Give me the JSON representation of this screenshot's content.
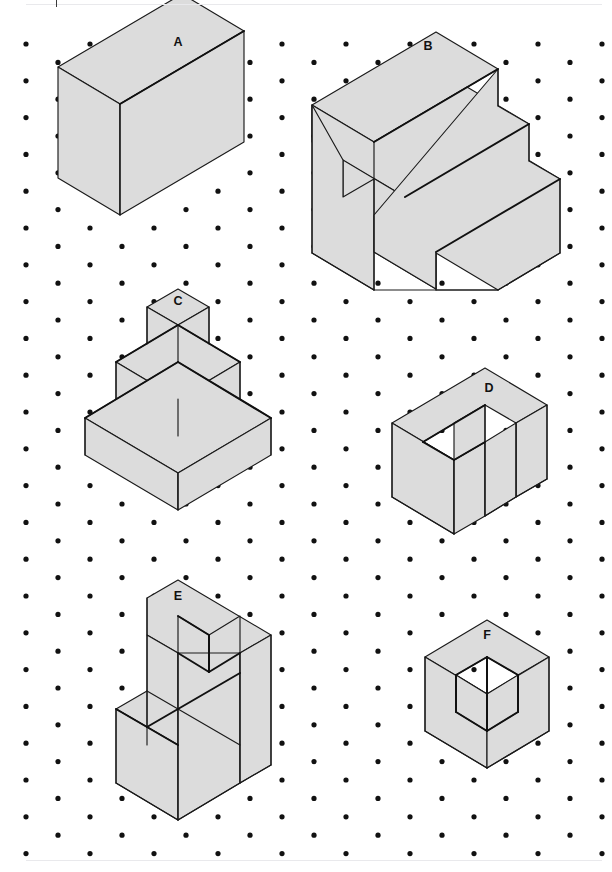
{
  "page": {
    "background_color": "#ffffff",
    "rule_color": "#e9e9ec",
    "width": 612,
    "height": 872
  },
  "grid": {
    "type": "isometric-dot-grid",
    "dot_color": "#111111",
    "dot_radius": 2.6,
    "column_spacing_px": 64,
    "row_spacing_px": 18.4,
    "origin_x": 26,
    "origin_y": 44,
    "columns": 10,
    "rows": 45,
    "stagger": "alternate rows offset by half column spacing"
  },
  "iso": {
    "unit_x": 31,
    "unit_y": 18.4,
    "vertical_unit_y": 37,
    "note": "isometric axes: right = (+31,+18.4), left = (-31,+18.4), up = (0,-37)"
  },
  "style": {
    "face_fill": "#dcdcdc",
    "edge_color": "#1a1a1a",
    "heavy_edge_color": "#111111",
    "label_color": "#111111"
  },
  "figures": [
    {
      "id": "A",
      "label": "A",
      "name": "rectangular-prism",
      "description": "Solid rectangular block, 3 units wide by 2 units deep by 2 units tall",
      "label_pos": {
        "x": 178,
        "y": 46
      },
      "origin": {
        "x": 120,
        "y": 251
      },
      "faces": [
        {
          "name": "top-face",
          "points": "120,104 58,67 182,-6 244,31"
        },
        {
          "name": "left-face",
          "points": "120,104 58,67 58,178 120,215"
        },
        {
          "name": "right-face",
          "points": "120,104 244,31 244,142 120,215"
        }
      ],
      "edges": [
        {
          "name": "vertical-front-edge",
          "d": "M120,104 L120,215"
        }
      ],
      "heavy_edges": [
        {
          "name": "top-right-ridge",
          "d": "M120,104 L244,31"
        }
      ]
    },
    {
      "id": "B",
      "label": "B",
      "name": "three-step-staircase",
      "description": "Three-tier staircase descending left to right, each step 1 unit tall and 1 unit deep",
      "label_pos": {
        "x": 428,
        "y": 50
      },
      "faces": [
        {
          "name": "step1-top",
          "points": "374,142 312,105 436,32 498,69"
        },
        {
          "name": "step2-top",
          "points": "405,197 343,160 467,87 529,124"
        },
        {
          "name": "step3-top",
          "points": "436,252 374,215 498,142 560,179"
        },
        {
          "name": "step1-riser",
          "points": "374,142 312,105 312,142 374,179"
        },
        {
          "name": "step2-riser",
          "points": "405,197 343,160 343,197 405,234"
        },
        {
          "name": "step3-riser",
          "points": "436,252 374,215 374,252 436,289"
        },
        {
          "name": "left-side-face",
          "points": "312,105 312,253 374,290 374,179 343,197 343,160"
        },
        {
          "name": "right-end-face-1",
          "points": "498,69 498,106 529,124 529,161 560,179 560,253 498,290 436,253 436,289 374,252 374,215"
        }
      ],
      "edges": [
        {
          "name": "step1-right-vertical",
          "d": "M498,69 L498,106"
        },
        {
          "name": "step2-right-vertical",
          "d": "M529,124 L529,161"
        },
        {
          "name": "step3-right-vertical",
          "d": "M560,179 L560,253"
        },
        {
          "name": "front-bottom-vertical",
          "d": "M436,253 L436,290"
        },
        {
          "name": "left-front-vertical",
          "d": "M374,179 L374,290"
        },
        {
          "name": "left-back-vertical",
          "d": "M312,105 L312,253"
        },
        {
          "name": "bottom-left-run",
          "d": "M312,253 L374,290"
        },
        {
          "name": "bottom-right-run",
          "d": "M436,290 L498,290 L498,290"
        },
        {
          "name": "bottom-front-run",
          "d": "M374,290 L498,290"
        },
        {
          "name": "bottom-right-rise",
          "d": "M498,290 L560,253"
        }
      ],
      "heavy_edges": [
        {
          "name": "step1-front-ridge",
          "d": "M374,142 L498,69"
        },
        {
          "name": "step2-front-ridge",
          "d": "M405,197 L529,124"
        },
        {
          "name": "step3-front-ridge",
          "d": "M436,252 L560,179"
        }
      ]
    },
    {
      "id": "C",
      "label": "C",
      "name": "stepped-pyramid",
      "description": "Three-tier stepped pyramid; tiers of 3x3, 2x2 and 1x1 units, each 1 unit tall",
      "label_pos": {
        "x": 178,
        "y": 305
      },
      "faces": [
        {
          "name": "tier3-top",
          "points": "178,325 147,307 178,289 209,307"
        },
        {
          "name": "tier3-left-face",
          "points": "147,307 147,344 178,362 178,325"
        },
        {
          "name": "tier3-right-face",
          "points": "209,307 209,344 178,362 178,325"
        },
        {
          "name": "tier2-top",
          "points": "178,399 116,362 178,325 240,362"
        },
        {
          "name": "tier2-left-face",
          "points": "116,362 116,399 178,436 178,399"
        },
        {
          "name": "tier2-right-face",
          "points": "240,362 240,399 178,436 178,399"
        },
        {
          "name": "tier1-top",
          "points": "178,473 85,418 178,362 271,418"
        },
        {
          "name": "tier1-left-face",
          "points": "85,418 85,455 178,510 178,473"
        },
        {
          "name": "tier1-right-face",
          "points": "271,418 271,455 178,510 178,473"
        }
      ],
      "edges": [
        {
          "name": "tier3-front-vertical",
          "d": "M178,325 L178,362"
        },
        {
          "name": "tier2-front-vertical",
          "d": "M178,399 L178,436"
        },
        {
          "name": "tier1-front-vertical",
          "d": "M178,473 L178,510"
        },
        {
          "name": "tier3-left-vertical",
          "d": "M147,307 L147,344"
        },
        {
          "name": "tier3-right-vertical",
          "d": "M209,307 L209,344"
        },
        {
          "name": "tier2-left-vertical",
          "d": "M116,362 L116,399"
        },
        {
          "name": "tier2-right-vertical",
          "d": "M240,362 L240,399"
        },
        {
          "name": "tier1-left-vertical",
          "d": "M85,418 L85,455"
        },
        {
          "name": "tier1-right-vertical",
          "d": "M271,418 L271,455"
        }
      ],
      "heavy_edges": [
        {
          "name": "tier2-top-left-ridge",
          "d": "M116,362 L178,325"
        },
        {
          "name": "tier2-top-right-ridge",
          "d": "M178,325 L240,362"
        },
        {
          "name": "tier1-top-left-ridge",
          "d": "M85,418 L178,362"
        },
        {
          "name": "tier1-top-right-ridge",
          "d": "M178,362 L271,418"
        }
      ]
    },
    {
      "id": "D",
      "label": "D",
      "name": "u-shaped-block",
      "description": "Rectangular block with a square notch cut from the top front, forming a U in plan",
      "label_pos": {
        "x": 489,
        "y": 392
      },
      "faces": [
        {
          "name": "top-face",
          "points": "454,460 392,423 485,368 547,405 516,423 485,405 423,442"
        },
        {
          "name": "left-front-face",
          "points": "392,423 392,497 454,534 454,460"
        },
        {
          "name": "left-back-face",
          "points": "454,460 454,534 485,516 485,442"
        },
        {
          "name": "notch-inner-face",
          "points": "454,460 485,442 485,405 454,423"
        },
        {
          "name": "right-prong-face",
          "points": "516,423 516,497 547,479 547,405"
        },
        {
          "name": "right-front-face",
          "points": "485,442 485,516 516,497 516,423"
        }
      ],
      "edges": [
        {
          "name": "left-front-vertical",
          "d": "M392,423 L392,497"
        },
        {
          "name": "front-mid-vertical",
          "d": "M454,460 L454,534"
        },
        {
          "name": "notch-vertical",
          "d": "M485,405 L485,516"
        },
        {
          "name": "right-prong-vertical",
          "d": "M516,423 L516,497"
        },
        {
          "name": "right-outer-vertical",
          "d": "M547,405 L547,479"
        },
        {
          "name": "bottom-left-run",
          "d": "M392,497 L454,534"
        },
        {
          "name": "bottom-right-run",
          "d": "M485,516 L516,497 L547,479"
        }
      ],
      "heavy_edges": [
        {
          "name": "notch-left-ridge",
          "d": "M423,442 L485,405"
        },
        {
          "name": "notch-bottom-edge",
          "d": "M423,442 L454,460"
        },
        {
          "name": "notch-right-ridge",
          "d": "M454,460 L485,442"
        }
      ]
    },
    {
      "id": "E",
      "label": "E",
      "name": "stepped-block-with-notch",
      "description": "Tall L-shaped stepped solid with a rectangular notch cut into the upper top surface",
      "label_pos": {
        "x": 178,
        "y": 600
      },
      "faces": [
        {
          "name": "upper-top-face",
          "points": "178,653 147,635 147,598 178,580 271,635 240,653 209,635 209,672"
        },
        {
          "name": "notch-inner-left",
          "points": "209,635 209,672 178,653 178,616"
        },
        {
          "name": "notch-inner-right",
          "points": "209,672 240,653 240,616 209,635"
        },
        {
          "name": "step-top-face",
          "points": "147,727 116,709 147,691 240,745"
        },
        {
          "name": "left-upper-face",
          "points": "147,635 147,727 178,745 178,653"
        },
        {
          "name": "lower-left-face",
          "points": "116,709 116,783 178,820 178,745"
        },
        {
          "name": "front-right-face",
          "points": "178,653 178,820 240,783 240,653"
        },
        {
          "name": "right-outer-face",
          "points": "240,653 240,783 271,765 271,635"
        }
      ],
      "edges": [
        {
          "name": "upper-left-vertical",
          "d": "M147,598 L147,727"
        },
        {
          "name": "upper-front-vertical",
          "d": "M178,653 L178,820"
        },
        {
          "name": "right-mid-vertical",
          "d": "M240,653 L240,783"
        },
        {
          "name": "right-outer-vertical",
          "d": "M271,635 L271,765"
        },
        {
          "name": "lower-left-vertical",
          "d": "M116,709 L116,783"
        },
        {
          "name": "step-front-vertical",
          "d": "M147,727 L147,745"
        },
        {
          "name": "bottom-left-run",
          "d": "M116,783 L178,820"
        },
        {
          "name": "bottom-right-run",
          "d": "M178,820 L240,783 L271,765"
        },
        {
          "name": "step-face-ridge",
          "d": "M147,691 L240,745"
        }
      ],
      "heavy_edges": [
        {
          "name": "notch-left-vertical",
          "d": "M209,635 L209,672"
        },
        {
          "name": "notch-right-edge",
          "d": "M209,672 L240,653"
        },
        {
          "name": "notch-bottom-edge",
          "d": "M178,653 L209,672"
        },
        {
          "name": "notch-top-edge",
          "d": "M178,616 L209,635"
        },
        {
          "name": "step-top-ridge",
          "d": "M116,709 L178,745"
        },
        {
          "name": "step-top-ridge-2",
          "d": "M147,727 L240,673"
        }
      ]
    },
    {
      "id": "F",
      "label": "F",
      "name": "cube-with-corner-notch",
      "description": "Cube of 2 units with a 1-unit cube removed from the near top corner",
      "label_pos": {
        "x": 487,
        "y": 639
      },
      "faces": [
        {
          "name": "top-face",
          "points": "487,694 425,657 487,620 549,657 518,675 487,657 456,675"
        },
        {
          "name": "left-face",
          "points": "425,657 425,731 487,768 487,694"
        },
        {
          "name": "right-face",
          "points": "549,657 549,731 487,768 487,694"
        },
        {
          "name": "notch-left-inner",
          "points": "456,675 487,694 487,731 456,712"
        },
        {
          "name": "notch-right-inner",
          "points": "518,675 487,694 487,731 518,712"
        }
      ],
      "edges": [
        {
          "name": "left-outer-vertical",
          "d": "M425,657 L425,731"
        },
        {
          "name": "right-outer-vertical",
          "d": "M549,657 L549,731"
        },
        {
          "name": "front-bottom-vertical",
          "d": "M487,768 L487,768"
        },
        {
          "name": "bottom-left-run",
          "d": "M425,731 L487,768"
        },
        {
          "name": "bottom-right-run",
          "d": "M487,768 L549,731"
        }
      ],
      "heavy_edges": [
        {
          "name": "notch-center-vertical",
          "d": "M487,657 L487,731"
        },
        {
          "name": "notch-left-top-edge",
          "d": "M456,675 L487,657"
        },
        {
          "name": "notch-right-top-edge",
          "d": "M487,657 L518,675"
        },
        {
          "name": "notch-left-vertical",
          "d": "M456,675 L456,712"
        },
        {
          "name": "notch-right-vertical",
          "d": "M518,675 L518,712"
        },
        {
          "name": "notch-left-bottom",
          "d": "M456,712 L487,731"
        },
        {
          "name": "notch-right-bottom",
          "d": "M487,731 L518,712"
        }
      ]
    }
  ]
}
